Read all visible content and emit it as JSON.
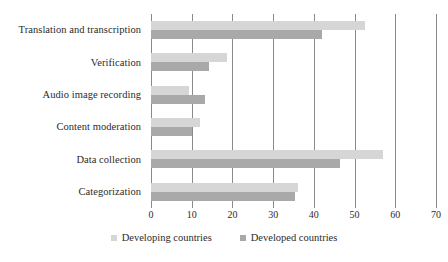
{
  "chart_data": {
    "type": "bar",
    "orientation": "horizontal",
    "title": "",
    "subtitle": "",
    "xlabel": "",
    "ylabel": "",
    "xlim": [
      0,
      70
    ],
    "xticks": [
      0,
      10,
      20,
      30,
      40,
      50,
      60,
      70
    ],
    "xtick_labels": [
      "0",
      "10",
      "20",
      "30",
      "40",
      "50",
      "60",
      "70"
    ],
    "grid": "vertical",
    "legend_position": "bottom-center",
    "categories": [
      "Translation and transcription",
      "Verification",
      "Audio image recording",
      "Content moderation",
      "Data collection",
      "Categorization"
    ],
    "series": [
      {
        "name": "Developing countries",
        "color": "#d6d6d6",
        "values": [
          52.5,
          18.7,
          9.3,
          12.0,
          57.0,
          36.0
        ]
      },
      {
        "name": "Developed countries",
        "color": "#a9a9a9",
        "values": [
          42.0,
          14.3,
          13.2,
          10.0,
          46.5,
          35.3
        ]
      }
    ]
  },
  "legend": {
    "items": [
      {
        "label": "Developing countries"
      },
      {
        "label": "Developed countries"
      }
    ]
  }
}
